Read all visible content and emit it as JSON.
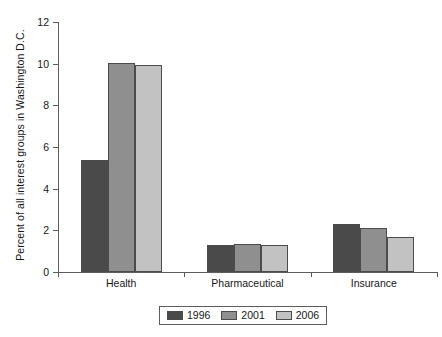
{
  "chart_data": {
    "type": "bar",
    "title": "",
    "xlabel": "",
    "ylabel": "Percent of all interest groups in Washington D.C.",
    "categories": [
      "Health",
      "Pharmaceutical",
      "Insurance"
    ],
    "series": [
      {
        "name": "1996",
        "color": "#4a4a4a",
        "values": [
          5.4,
          1.3,
          2.3
        ]
      },
      {
        "name": "2001",
        "color": "#8f8f8f",
        "values": [
          10.05,
          1.35,
          2.1
        ]
      },
      {
        "name": "2006",
        "color": "#c2c2c2",
        "values": [
          9.95,
          1.3,
          1.7
        ]
      }
    ],
    "ylim": [
      0,
      12
    ],
    "yticks": [
      0,
      2,
      4,
      6,
      8,
      10,
      12
    ],
    "ytick_labels": [
      "0",
      "2",
      "4",
      "6",
      "8",
      "10",
      "12"
    ],
    "grid": false,
    "legend_position": "bottom-center",
    "legend_entries": [
      "1996",
      "2001",
      "2006"
    ],
    "axis_color": "#5d5d5d",
    "bar_edge_color": "#4b4b4b",
    "background": "#ffffff"
  }
}
